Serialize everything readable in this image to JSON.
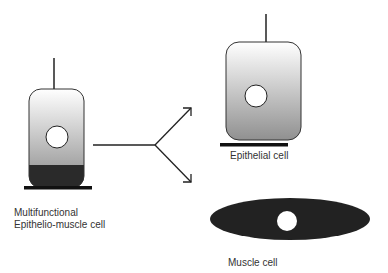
{
  "diagram": {
    "type": "cell differentiation schematic",
    "colors": {
      "stroke": "#222222",
      "gradient_top": "#ffffff",
      "gradient_bottom": "#8a8a8a",
      "dark_fill": "#2a2a2a",
      "nucleus": "#ffffff"
    },
    "nodes": [
      {
        "id": "source",
        "label_lines": [
          "Multifunctional",
          "Epithelio-muscle cell"
        ]
      },
      {
        "id": "epithelial",
        "label": "Epithelial cell"
      },
      {
        "id": "muscle",
        "label": "Muscle cell"
      }
    ],
    "edges": [
      {
        "from": "source",
        "to": "epithelial",
        "style": "arrow"
      },
      {
        "from": "source",
        "to": "muscle",
        "style": "arrow"
      }
    ]
  },
  "labels": {
    "source_line1": "Multifunctional",
    "source_line2": "Epithelio-muscle cell",
    "epithelial": "Epithelial cell",
    "muscle": "Muscle cell"
  }
}
